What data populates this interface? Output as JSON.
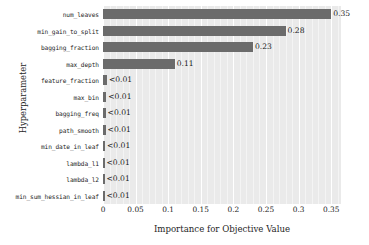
{
  "chart_data": {
    "type": "bar",
    "orientation": "horizontal",
    "title": "",
    "xlabel": "Importance for Objective Value",
    "ylabel": "Hyperparameter",
    "xlim": [
      0,
      0.365
    ],
    "xticks": [
      "0",
      "0.05",
      "0.1",
      "0.15",
      "0.2",
      "0.25",
      "0.3",
      "0.35"
    ],
    "xtick_values": [
      0,
      0.05,
      0.1,
      0.15,
      0.2,
      0.25,
      0.3,
      0.35
    ],
    "grid": true,
    "legend": "none",
    "bar_color": "#6b6b6b",
    "plot_background": "#eaeaea",
    "categories": [
      "num_leaves",
      "min_gain_to_split",
      "bagging_fraction",
      "max_depth",
      "feature_fraction",
      "max_bin",
      "bagging_freq",
      "path_smooth",
      "min_date_in_leaf",
      "lambda_l1",
      "lambda_l2",
      "min_sum_hessian_in_leaf"
    ],
    "values": [
      0.35,
      0.28,
      0.23,
      0.11,
      0.006,
      0.005,
      0.004,
      0.004,
      0.003,
      0.001,
      0.001,
      0.001
    ],
    "value_labels": [
      "0.35",
      "0.28",
      "0.23",
      "0.11",
      "<0.01",
      "<0.01",
      "<0.01",
      "<0.01",
      "<0.01",
      "<0.01",
      "<0.01",
      "<0.01"
    ]
  }
}
